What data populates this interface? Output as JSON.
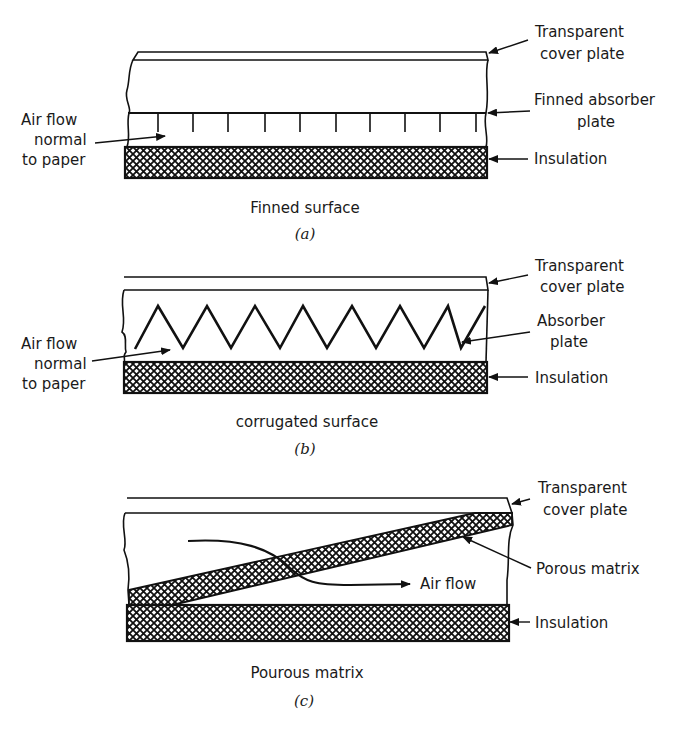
{
  "figure": {
    "panels": [
      {
        "id": "a",
        "caption": "Finned surface",
        "sublabel": "(a)",
        "labels": {
          "cover_1": "Transparent",
          "cover_2": "cover plate",
          "absorber_1": "Finned absorber",
          "absorber_2": "plate",
          "insulation": "Insulation",
          "airflow_1": "Air flow",
          "airflow_2": "normal",
          "airflow_3": "to paper"
        }
      },
      {
        "id": "b",
        "caption": "corrugated surface",
        "sublabel": "(b)",
        "labels": {
          "cover_1": "Transparent",
          "cover_2": "cover plate",
          "absorber_1": "Absorber",
          "absorber_2": "plate",
          "insulation": "Insulation",
          "airflow_1": "Air flow",
          "airflow_2": "normal",
          "airflow_3": "to paper"
        }
      },
      {
        "id": "c",
        "caption": "Pourous matrix",
        "sublabel": "(c)",
        "labels": {
          "cover_1": "Transparent",
          "cover_2": "cover plate",
          "matrix": "Porous matrix",
          "insulation": "Insulation",
          "airflow": "Air flow"
        }
      }
    ]
  }
}
